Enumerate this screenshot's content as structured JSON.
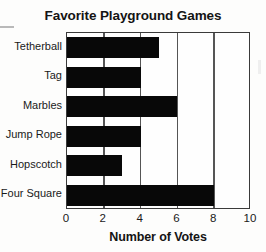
{
  "chart_data": {
    "type": "bar",
    "orientation": "horizontal",
    "title": "Favorite Playground Games",
    "xlabel": "Number of Votes",
    "ylabel": "",
    "categories": [
      "Tetherball",
      "Tag",
      "Marbles",
      "Jump Rope",
      "Hopscotch",
      "Four Square"
    ],
    "values": [
      5,
      4,
      6,
      4,
      3,
      8
    ],
    "xlim": [
      0,
      10
    ],
    "xticks": [
      0,
      2,
      4,
      6,
      8,
      10
    ],
    "xtick_labels": [
      "0",
      "2",
      "4",
      "6",
      "8",
      "10"
    ],
    "grid": "vertical",
    "legend": "none",
    "bar_color": "#080808",
    "plot_background": "#fefefe",
    "axis_color": "#3a3a3a"
  },
  "chart": {
    "title": "Favorite Playground Games",
    "axis_title_x": "Number of Votes"
  }
}
